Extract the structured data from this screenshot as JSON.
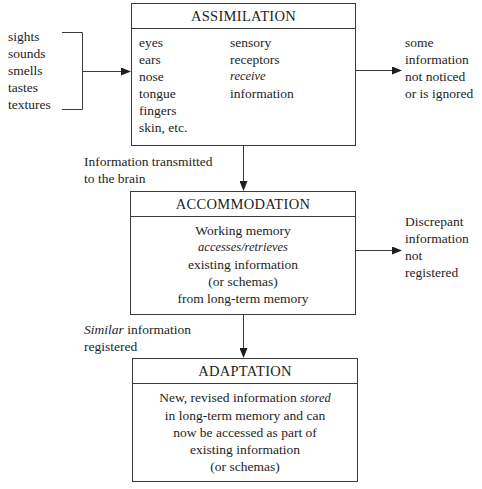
{
  "diagram": {
    "inputs": [
      "sights",
      "sounds",
      "smells",
      "tastes",
      "textures"
    ],
    "assimilation": {
      "title": "ASSIMILATION",
      "organs": [
        "eyes",
        "ears",
        "nose",
        "tongue",
        "fingers",
        "skin, etc."
      ],
      "receptor_text": {
        "line1": "sensory",
        "line2": "receptors",
        "line3_italic": "receive",
        "line4": "information"
      },
      "side_output": [
        "some",
        "information",
        "not noticed",
        "or is ignored"
      ]
    },
    "transition_1": [
      "Information transmitted",
      "to the brain"
    ],
    "accommodation": {
      "title": "ACCOMMODATION",
      "line1": "Working memory",
      "line2_italic": "accesses/retrieves",
      "line3": "existing information",
      "line4": "(or schemas)",
      "line5": "from long-term memory",
      "side_output": [
        "Discrepant",
        "information",
        "not",
        "registered"
      ]
    },
    "transition_2": {
      "italic": "Similar",
      "rest": " information",
      "line2": "registered"
    },
    "adaptation": {
      "title": "ADAPTATION",
      "line1_pre": "New, revised information ",
      "line1_italic": "stored",
      "line2": "in long-term memory and can",
      "line3": "now be accessed as part of",
      "line4": "existing information",
      "line5": "(or schemas)"
    }
  },
  "colors": {
    "line": "#3a3a3a",
    "text": "#1e1e1e",
    "background": "#ffffff"
  }
}
